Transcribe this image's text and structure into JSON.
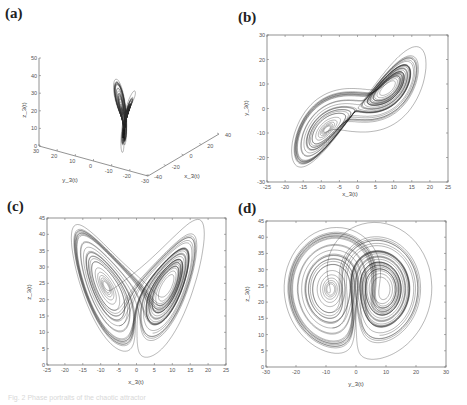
{
  "figure": {
    "caption": "Fig. 2 Phase portraits of the chaotic attractor"
  },
  "chart_data": [
    {
      "panel": "(a)",
      "type": "line",
      "subtype": "3d-phase-portrait",
      "title": "",
      "xlabel": "x_3(t)",
      "ylabel": "y_3(t)",
      "zlabel": "z_3(t)",
      "xlim": [
        -40,
        40
      ],
      "ylim": [
        -30,
        30
      ],
      "zlim": [
        0,
        50
      ],
      "x_ticks": [
        "-40",
        "-20",
        "0",
        "20",
        "40"
      ],
      "y_ticks": [
        "30",
        "20",
        "10",
        "0",
        "-10",
        "-20",
        "-30"
      ],
      "z_ticks": [
        "0",
        "10",
        "20",
        "30",
        "40",
        "50"
      ],
      "grid": false,
      "description": "Double-scroll Lorenz-type attractor in 3D, two lobes centered near z≈27"
    },
    {
      "panel": "(b)",
      "type": "line",
      "subtype": "phase-portrait",
      "xlabel": "x_3(t)",
      "ylabel": "y_3(t)",
      "xlim": [
        -25,
        25
      ],
      "ylim": [
        -30,
        30
      ],
      "x_ticks": [
        "-25",
        "-20",
        "-15",
        "-10",
        "-5",
        "0",
        "5",
        "10",
        "15",
        "20",
        "25"
      ],
      "y_ticks": [
        "30",
        "20",
        "10",
        "0",
        "-10",
        "-20",
        "-30"
      ],
      "grid": false,
      "fixed_points": [
        [
          -8.5,
          -8.5
        ],
        [
          8.5,
          8.5
        ]
      ],
      "extent": {
        "x": [
          -20,
          24
        ],
        "y": [
          -23,
          25
        ]
      }
    },
    {
      "panel": "(c)",
      "type": "line",
      "subtype": "phase-portrait",
      "xlabel": "x_3(t)",
      "ylabel": "z_3(t)",
      "xlim": [
        -25,
        25
      ],
      "ylim": [
        0,
        45
      ],
      "x_ticks": [
        "-25",
        "-20",
        "-15",
        "-10",
        "-5",
        "0",
        "5",
        "10",
        "15",
        "20",
        "25"
      ],
      "y_ticks": [
        "45",
        "40",
        "35",
        "30",
        "25",
        "20",
        "15",
        "10",
        "5",
        "0"
      ],
      "grid": false,
      "fixed_points": [
        [
          -8.5,
          21
        ],
        [
          8.5,
          21
        ]
      ],
      "extent": {
        "x": [
          -20,
          24
        ],
        "y": [
          5,
          42
        ]
      }
    },
    {
      "panel": "(d)",
      "type": "line",
      "subtype": "phase-portrait",
      "xlabel": "y_3(t)",
      "ylabel": "z_3(t)",
      "xlim": [
        -30,
        30
      ],
      "ylim": [
        0,
        45
      ],
      "x_ticks": [
        "-30",
        "-20",
        "-10",
        "0",
        "10",
        "20",
        "30"
      ],
      "y_ticks": [
        "45",
        "40",
        "35",
        "30",
        "25",
        "20",
        "15",
        "10",
        "5",
        "0"
      ],
      "grid": false,
      "fixed_points": [
        [
          -8.5,
          21
        ],
        [
          8.5,
          21
        ]
      ],
      "extent": {
        "x": [
          -23,
          27
        ],
        "y": [
          5,
          42
        ]
      }
    }
  ],
  "panels": {
    "a": {
      "label": "(a)"
    },
    "b": {
      "label": "(b)"
    },
    "c": {
      "label": "(c)"
    },
    "d": {
      "label": "(d)"
    }
  },
  "lorenz": {
    "sigma": 10,
    "rho": 28,
    "beta": 2.6667,
    "dt": 0.006,
    "steps": 7000,
    "start": [
      1.0,
      1.0,
      20.0
    ]
  },
  "colors": {
    "curve": "#2a2a2a",
    "axis": "#777777",
    "text": "#444444"
  }
}
